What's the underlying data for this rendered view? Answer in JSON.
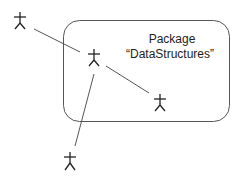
{
  "diagram": {
    "type": "uml-package-with-actors",
    "package": {
      "label_line1": "Package",
      "label_line2": "“DataStructures”"
    },
    "actors": [
      {
        "id": "actor-outside-top",
        "x": 20,
        "y": 12
      },
      {
        "id": "actor-inside-center",
        "x": 94,
        "y": 49
      },
      {
        "id": "actor-inside-bottom-right",
        "x": 160,
        "y": 94
      },
      {
        "id": "actor-outside-bottom",
        "x": 70,
        "y": 152
      }
    ],
    "connections": [
      {
        "from": "actor-outside-top",
        "to": "actor-inside-center"
      },
      {
        "from": "actor-inside-center",
        "to": "actor-inside-bottom-right"
      },
      {
        "from": "actor-inside-center",
        "to": "actor-outside-bottom"
      }
    ],
    "colors": {
      "stroke": "#444444",
      "text": "#222222",
      "background": "#ffffff"
    }
  }
}
